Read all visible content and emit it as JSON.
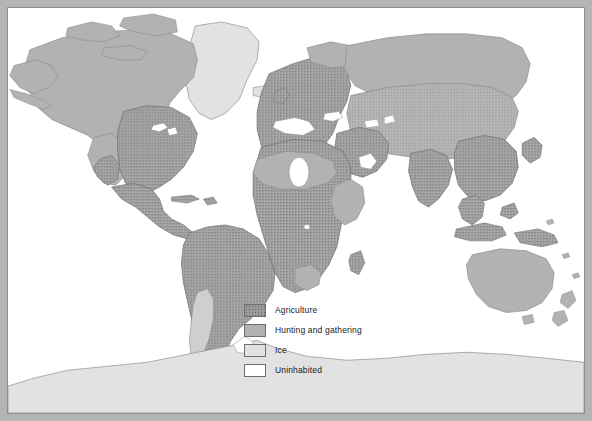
{
  "figure": {
    "kind": "thematic-world-map",
    "projection_note": "world map, equal-area style",
    "background": "#ffffff",
    "frame_color": "#b4b4b4",
    "frame_line_color": "#8e8e8e"
  },
  "legend": {
    "items": [
      {
        "label": "Agriculture",
        "color": "#9a9a9a",
        "pattern": "dotted",
        "key": "agriculture"
      },
      {
        "label": "Hunting and gathering",
        "color": "#b2b2b2",
        "pattern": "solid",
        "key": "hunting"
      },
      {
        "label": "Ice",
        "color": "#e2e2e2",
        "pattern": "solid",
        "key": "ice"
      },
      {
        "label": "Uninhabited",
        "color": "#ffffff",
        "pattern": "solid",
        "key": "uninhabited"
      }
    ]
  },
  "map_regions": {
    "agriculture": [
      "Eastern and central United States",
      "Mexico and Central America",
      "South America",
      "Europe",
      "North Africa coast",
      "Sub-Saharan Africa",
      "Middle East",
      "India",
      "China",
      "Southeast Asia",
      "Indonesia and New Guinea",
      "Japan"
    ],
    "hunting": [
      "Alaska",
      "Canada",
      "Canadian Arctic archipelago",
      "Western United States",
      "Patagonia and southern Argentina",
      "Sahara margins",
      "Horn of Africa",
      "Kalahari southern Africa",
      "Siberia",
      "Northern Scandinavia",
      "Australia",
      "Tasmania",
      "New Zealand"
    ],
    "ice": [
      "Greenland",
      "Antarctica",
      "Iceland",
      "Arctic ice margin"
    ],
    "uninhabited": [
      "Central Sahara desert",
      "Arabian desert interior"
    ]
  }
}
